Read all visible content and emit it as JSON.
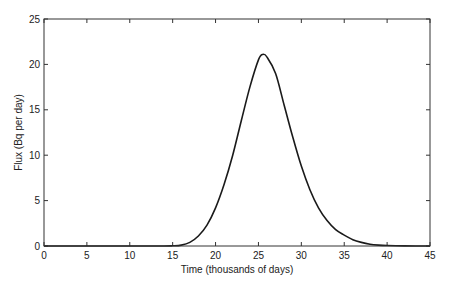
{
  "chart_data": {
    "type": "line",
    "title": "",
    "xlabel": "Time (thousands of days)",
    "ylabel": "Flux (Bq per day)",
    "xlim": [
      0,
      45
    ],
    "ylim": [
      0,
      25
    ],
    "xticks": [
      0,
      5,
      10,
      15,
      20,
      25,
      30,
      35,
      40,
      45
    ],
    "yticks": [
      0,
      5,
      10,
      15,
      20,
      25
    ],
    "grid": false,
    "legend": null,
    "series": [
      {
        "name": "Flux",
        "color": "#1a1a1a",
        "x": [
          0,
          5,
          10,
          14,
          15,
          16,
          17,
          18,
          19,
          20,
          21,
          22,
          23,
          24,
          25,
          25.5,
          26,
          27,
          28,
          29,
          30,
          31,
          32,
          33,
          34,
          35,
          36,
          37,
          38,
          39,
          40,
          42,
          45
        ],
        "y": [
          0,
          0,
          0,
          0,
          0.02,
          0.1,
          0.4,
          1.1,
          2.3,
          4.2,
          6.8,
          10.0,
          13.8,
          17.5,
          20.5,
          21.1,
          20.8,
          19.0,
          15.5,
          12.0,
          8.8,
          6.2,
          4.2,
          2.8,
          1.8,
          1.2,
          0.7,
          0.4,
          0.2,
          0.1,
          0.05,
          0.01,
          0
        ]
      }
    ]
  },
  "axes": {
    "x_label": "Time (thousands of days)",
    "y_label": "Flux (Bq per day)"
  }
}
